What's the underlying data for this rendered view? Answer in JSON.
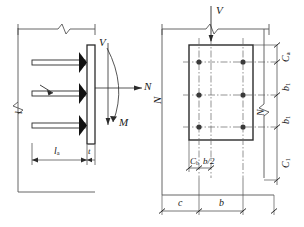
{
  "figure": {
    "colors": {
      "line": "#2b2b2b",
      "thin_line": "#555555",
      "center_line": "#666666",
      "fill": "#ffffff",
      "bolt": "#3a3a3a",
      "weld": "#111111",
      "background": "#ffffff"
    },
    "left_view": {
      "name": "elevation-view",
      "labels": {
        "shear_force": "V",
        "axial_force": "N",
        "moment": "M",
        "anchor_length": "l",
        "anchor_length_sub": "a",
        "plate_thickness": "t"
      },
      "anchor_rod_count": 3,
      "break_symbols": 2
    },
    "right_view": {
      "name": "plan-view",
      "labels": {
        "shear_force": "V",
        "axial_force": "N",
        "edge_distance_a": "C",
        "edge_distance_a_sub": "a",
        "bolt_spacing_1": "b",
        "bolt_spacing_1_sub": "1",
        "bolt_spacing_2": "b",
        "bolt_spacing_2_sub": "1",
        "edge_distance_1": "C",
        "edge_distance_1_sub": "1",
        "edge_distance_b": "C",
        "edge_distance_b_sub": "b",
        "half_width": "b/2",
        "dim_c": "c",
        "dim_b": "b"
      },
      "bolt_rows": 3,
      "bolt_columns": 2,
      "bolt_total": 6,
      "break_symbols": 2
    }
  }
}
